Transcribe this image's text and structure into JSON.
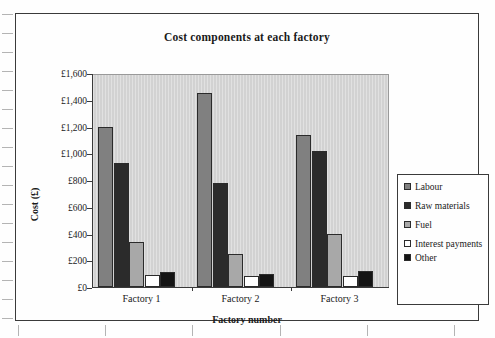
{
  "chart_data": {
    "type": "bar",
    "title": "Cost components at each factory",
    "xlabel": "Factory number",
    "ylabel": "Cost (£)",
    "categories": [
      "Factory 1",
      "Factory 2",
      "Factory 3"
    ],
    "ylim": [
      0,
      1600
    ],
    "ytick_labels": [
      "£0",
      "£200",
      "£400",
      "£600",
      "£800",
      "£1,000",
      "£1,200",
      "£1,400",
      "£1,600"
    ],
    "ytick_values": [
      0,
      200,
      400,
      600,
      800,
      1000,
      1200,
      1400,
      1600
    ],
    "grid": false,
    "legend_position": "right",
    "series": [
      {
        "name": "Labour",
        "color": "#808080",
        "values": [
          1200,
          1450,
          1140
        ]
      },
      {
        "name": "Raw materials",
        "color": "#2b2b2b",
        "values": [
          930,
          780,
          1020
        ]
      },
      {
        "name": "Fuel",
        "color": "#a8a8a8",
        "values": [
          340,
          250,
          400
        ]
      },
      {
        "name": "Interest payments",
        "color": "#ffffff",
        "values": [
          90,
          80,
          80
        ]
      },
      {
        "name": "Other",
        "color": "#141414",
        "values": [
          110,
          100,
          120
        ]
      }
    ]
  },
  "legend": {
    "entries": [
      {
        "label": "Labour"
      },
      {
        "label": "Raw materials"
      },
      {
        "label": "Fuel"
      },
      {
        "label": "Interest payments"
      },
      {
        "label": "Other"
      }
    ]
  }
}
